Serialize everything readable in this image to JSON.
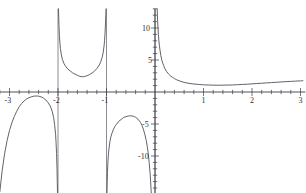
{
  "figure": {
    "title": "",
    "background_color": "#ffffff",
    "axis_color": "#3d3d47",
    "curve_color": "#5a5a62",
    "width": 306,
    "height": 193
  },
  "chart_data": {
    "type": "line",
    "title": "",
    "xlabel": "",
    "ylabel": "",
    "xlim": [
      -3.2,
      3.1
    ],
    "ylim": [
      -15.8,
      13.0
    ],
    "grid": false,
    "legend": null,
    "x_ticks_major": [
      -3,
      -2,
      -1,
      1,
      2,
      3
    ],
    "x_tick_labels": [
      "-3",
      "-2",
      "-1",
      "1",
      "2",
      "3"
    ],
    "x_minor_tick_step": 0.2,
    "y_ticks_major": [
      -10,
      -5,
      5,
      10
    ],
    "y_tick_labels": [
      "-10",
      "-5",
      "5",
      "10"
    ],
    "y_minor_tick_step": 1,
    "vertical_asymptotes": [
      -2,
      -1,
      0
    ],
    "annotations": [],
    "series": [
      {
        "name": "branch-left-of-minus2",
        "comment": "x < -2, inverted-U opening downward, local max near y = -0.6",
        "points": [
          [
            -3.2,
            -15.6
          ],
          [
            -3.15,
            -12.2
          ],
          [
            -3.1,
            -9.6
          ],
          [
            -3.05,
            -7.6
          ],
          [
            -3.0,
            -6.0
          ],
          [
            -2.95,
            -4.8
          ],
          [
            -2.9,
            -3.8
          ],
          [
            -2.85,
            -3.0
          ],
          [
            -2.8,
            -2.3
          ],
          [
            -2.75,
            -1.8
          ],
          [
            -2.7,
            -1.4
          ],
          [
            -2.65,
            -1.1
          ],
          [
            -2.6,
            -0.9
          ],
          [
            -2.55,
            -0.75
          ],
          [
            -2.5,
            -0.65
          ],
          [
            -2.45,
            -0.62
          ],
          [
            -2.4,
            -0.65
          ],
          [
            -2.35,
            -0.75
          ],
          [
            -2.3,
            -0.95
          ],
          [
            -2.25,
            -1.25
          ],
          [
            -2.2,
            -1.7
          ],
          [
            -2.16,
            -2.2
          ],
          [
            -2.12,
            -3.0
          ],
          [
            -2.09,
            -4.0
          ],
          [
            -2.07,
            -5.1
          ],
          [
            -2.05,
            -6.6
          ],
          [
            -2.04,
            -7.9
          ],
          [
            -2.03,
            -9.6
          ],
          [
            -2.02,
            -12.0
          ],
          [
            -2.015,
            -14.0
          ],
          [
            -2.01,
            -15.8
          ]
        ]
      },
      {
        "name": "branch-minus2-to-minus1",
        "comment": "U-shaped branch between the x = -2 and x = -1 asymptotes, minimum near y = 2.3 at x = -1.5",
        "points": [
          [
            -1.99,
            13.0
          ],
          [
            -1.985,
            11.6
          ],
          [
            -1.98,
            10.4
          ],
          [
            -1.97,
            8.7
          ],
          [
            -1.96,
            7.6
          ],
          [
            -1.95,
            6.8
          ],
          [
            -1.93,
            5.8
          ],
          [
            -1.91,
            5.1
          ],
          [
            -1.88,
            4.5
          ],
          [
            -1.85,
            4.1
          ],
          [
            -1.8,
            3.6
          ],
          [
            -1.75,
            3.3
          ],
          [
            -1.7,
            3.0
          ],
          [
            -1.65,
            2.8
          ],
          [
            -1.6,
            2.6
          ],
          [
            -1.55,
            2.45
          ],
          [
            -1.5,
            2.38
          ],
          [
            -1.45,
            2.42
          ],
          [
            -1.4,
            2.55
          ],
          [
            -1.35,
            2.72
          ],
          [
            -1.3,
            2.95
          ],
          [
            -1.25,
            3.25
          ],
          [
            -1.2,
            3.65
          ],
          [
            -1.15,
            4.2
          ],
          [
            -1.12,
            4.7
          ],
          [
            -1.09,
            5.4
          ],
          [
            -1.07,
            6.1
          ],
          [
            -1.05,
            7.2
          ],
          [
            -1.04,
            8.0
          ],
          [
            -1.03,
            9.2
          ],
          [
            -1.02,
            10.8
          ],
          [
            -1.015,
            11.9
          ],
          [
            -1.01,
            13.0
          ]
        ]
      },
      {
        "name": "branch-minus1-to-0",
        "comment": "Downward-opening branch between x = -1 and x = 0, local max near y = -3.7 at x = -0.5",
        "points": [
          [
            -0.99,
            -15.8
          ],
          [
            -0.985,
            -14.0
          ],
          [
            -0.98,
            -12.6
          ],
          [
            -0.97,
            -10.8
          ],
          [
            -0.96,
            -9.7
          ],
          [
            -0.95,
            -8.9
          ],
          [
            -0.93,
            -7.8
          ],
          [
            -0.91,
            -7.0
          ],
          [
            -0.89,
            -6.5
          ],
          [
            -0.86,
            -5.9
          ],
          [
            -0.83,
            -5.4
          ],
          [
            -0.8,
            -5.1
          ],
          [
            -0.75,
            -4.6
          ],
          [
            -0.7,
            -4.3
          ],
          [
            -0.65,
            -4.0
          ],
          [
            -0.6,
            -3.85
          ],
          [
            -0.55,
            -3.75
          ],
          [
            -0.5,
            -3.72
          ],
          [
            -0.45,
            -3.78
          ],
          [
            -0.4,
            -3.95
          ],
          [
            -0.35,
            -4.25
          ],
          [
            -0.3,
            -4.75
          ],
          [
            -0.27,
            -5.2
          ],
          [
            -0.24,
            -5.8
          ],
          [
            -0.21,
            -6.6
          ],
          [
            -0.18,
            -7.6
          ],
          [
            -0.16,
            -8.5
          ],
          [
            -0.14,
            -9.6
          ],
          [
            -0.12,
            -11.0
          ],
          [
            -0.1,
            -12.8
          ],
          [
            -0.09,
            -14.0
          ],
          [
            -0.08,
            -15.4
          ],
          [
            -0.075,
            -15.8
          ]
        ]
      },
      {
        "name": "branch-right-of-0",
        "comment": "x > 0, falls steeply from +infinity, flattens near y = 1 around x = 1.3, then rises slowly to about y = 1.7 at x = 3",
        "points": [
          [
            0.045,
            13.0
          ],
          [
            0.05,
            12.0
          ],
          [
            0.055,
            11.0
          ],
          [
            0.06,
            10.2
          ],
          [
            0.07,
            9.0
          ],
          [
            0.08,
            8.0
          ],
          [
            0.09,
            7.3
          ],
          [
            0.1,
            6.7
          ],
          [
            0.12,
            5.7
          ],
          [
            0.14,
            5.0
          ],
          [
            0.16,
            4.5
          ],
          [
            0.18,
            4.1
          ],
          [
            0.2,
            3.7
          ],
          [
            0.24,
            3.2
          ],
          [
            0.28,
            2.8
          ],
          [
            0.32,
            2.5
          ],
          [
            0.36,
            2.3
          ],
          [
            0.4,
            2.1
          ],
          [
            0.45,
            1.9
          ],
          [
            0.5,
            1.75
          ],
          [
            0.6,
            1.5
          ],
          [
            0.7,
            1.35
          ],
          [
            0.8,
            1.25
          ],
          [
            0.9,
            1.18
          ],
          [
            1.0,
            1.12
          ],
          [
            1.1,
            1.09
          ],
          [
            1.2,
            1.07
          ],
          [
            1.3,
            1.06
          ],
          [
            1.4,
            1.07
          ],
          [
            1.5,
            1.08
          ],
          [
            1.6,
            1.1
          ],
          [
            1.7,
            1.14
          ],
          [
            1.8,
            1.18
          ],
          [
            1.9,
            1.22
          ],
          [
            2.0,
            1.27
          ],
          [
            2.1,
            1.32
          ],
          [
            2.2,
            1.37
          ],
          [
            2.3,
            1.42
          ],
          [
            2.4,
            1.47
          ],
          [
            2.5,
            1.52
          ],
          [
            2.6,
            1.57
          ],
          [
            2.7,
            1.62
          ],
          [
            2.8,
            1.66
          ],
          [
            2.9,
            1.7
          ],
          [
            3.0,
            1.74
          ],
          [
            3.05,
            1.76
          ]
        ]
      }
    ]
  }
}
